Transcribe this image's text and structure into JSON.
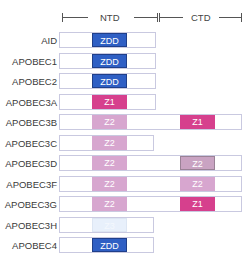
{
  "header": {
    "ntd_label": "NTD",
    "ctd_label": "CTD"
  },
  "colors": {
    "ZDD": "#2f5fc4",
    "Z1": "#d6408d",
    "Z2": "#d7a6cf",
    "Z2_alt": "#c9a3c2",
    "Z3": "#e8f0fb",
    "track_border": "#c9c9e0"
  },
  "rows": [
    {
      "label": "AID",
      "width": 97,
      "ntd": "ZDD",
      "ntd_color": "#2f5fc4",
      "ctd": null
    },
    {
      "label": "APOBEC1",
      "width": 97,
      "ntd": "ZDD",
      "ntd_color": "#2f5fc4",
      "ctd": null
    },
    {
      "label": "APOBEC2",
      "width": 97,
      "ntd": "ZDD",
      "ntd_color": "#2f5fc4",
      "ctd": null
    },
    {
      "label": "APOBEC3A",
      "width": 97,
      "ntd": "Z1",
      "ntd_color": "#d6408d",
      "ctd": null
    },
    {
      "label": "APOBEC3B",
      "width": 183,
      "ntd": "Z2",
      "ntd_color": "#d7a6cf",
      "ctd": "Z1",
      "ctd_color": "#d6408d"
    },
    {
      "label": "APOBEC3C",
      "width": 95,
      "ntd": "Z2",
      "ntd_color": "#d7a6cf",
      "ctd": null
    },
    {
      "label": "APOBEC3D",
      "width": 183,
      "ntd": "Z2",
      "ntd_color": "#d7a6cf",
      "ctd": "Z2",
      "ctd_color": "#c9a3c2"
    },
    {
      "label": "APOBEC3F",
      "width": 183,
      "ntd": "Z2",
      "ntd_color": "#d7a6cf",
      "ctd": "Z2",
      "ctd_color": "#d7a6cf"
    },
    {
      "label": "APOBEC3G",
      "width": 183,
      "ntd": "Z2",
      "ntd_color": "#d7a6cf",
      "ctd": "Z1",
      "ctd_color": "#d6408d"
    },
    {
      "label": "APOBEC3H",
      "width": 95,
      "ntd": "Z3",
      "ntd_color": "#e8f0fb",
      "ctd": null
    },
    {
      "label": "APOBEC4",
      "width": 95,
      "ntd": "ZDD",
      "ntd_color": "#2f5fc4",
      "ctd": null
    }
  ]
}
